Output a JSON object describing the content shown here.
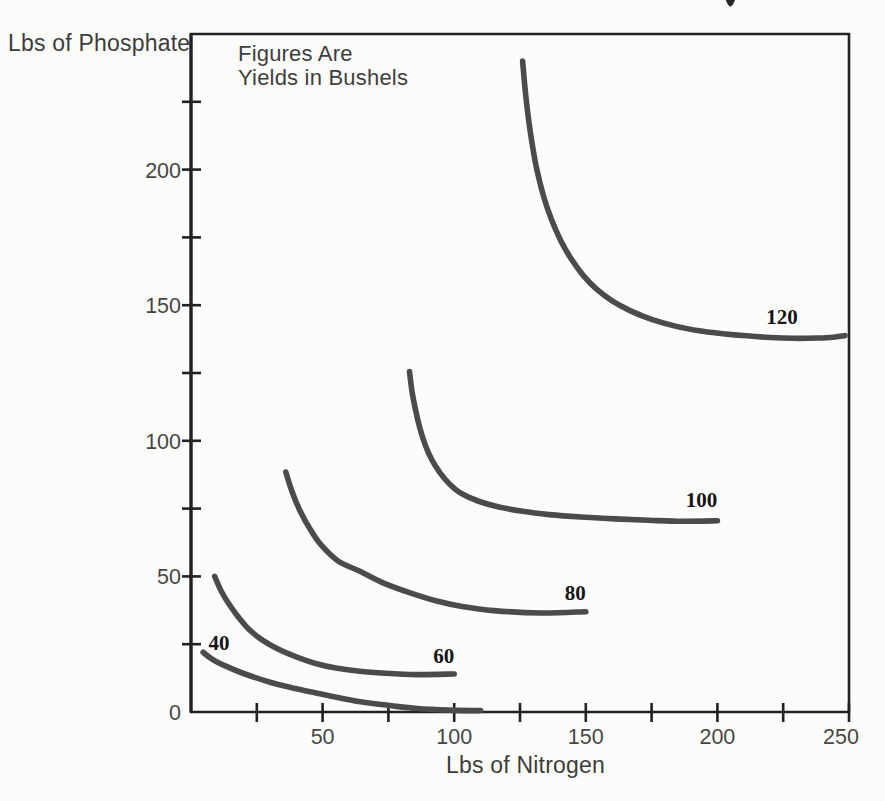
{
  "figure": {
    "y_axis_title": "Lbs of Phosphate",
    "x_axis_title": "Lbs of Nitrogen",
    "note_line1": "Figures Are",
    "note_line2": "Yields in Bushels"
  },
  "colors": {
    "background": "#fcfcfb",
    "axis": "#222222",
    "tick_label": "#464646",
    "title_text": "#3c3c3c",
    "curve": "#4b4b4b",
    "curve_label": "#151515"
  },
  "chart_data": {
    "type": "line",
    "subtype": "isoquant-map",
    "title": "",
    "annotation": "Figures Are Yields in Bushels",
    "xlabel": "Lbs of Nitrogen",
    "ylabel": "Lbs of Phosphate",
    "xlim": [
      0,
      250
    ],
    "ylim": [
      0,
      250
    ],
    "grid": false,
    "legend": "inline-curve-labels",
    "x_major_ticks": [
      50,
      100,
      150,
      200,
      250
    ],
    "x_minor_ticks": [
      25,
      75,
      125,
      175,
      225
    ],
    "y_major_ticks": [
      0,
      50,
      100,
      150,
      200
    ],
    "y_minor_ticks": [
      25,
      75,
      125,
      175,
      225
    ],
    "series": [
      {
        "name": "40",
        "yield_bushels": 40,
        "label_xy": [
          10.6,
          25.6
        ],
        "points": [
          [
            4.6,
            22
          ],
          [
            8,
            19.5
          ],
          [
            13,
            17
          ],
          [
            20,
            14.2
          ],
          [
            30,
            11
          ],
          [
            40,
            8.6
          ],
          [
            48,
            6.9
          ],
          [
            58,
            4.9
          ],
          [
            67,
            3.4
          ],
          [
            77,
            2.2
          ],
          [
            86,
            1.3
          ],
          [
            98,
            0.7
          ],
          [
            110,
            0.5
          ]
        ]
      },
      {
        "name": "60",
        "yield_bushels": 60,
        "label_xy": [
          96,
          20.8
        ],
        "points": [
          [
            9,
            50
          ],
          [
            11,
            45.5
          ],
          [
            13,
            42
          ],
          [
            15.5,
            38.3
          ],
          [
            18,
            35
          ],
          [
            22,
            30.5
          ],
          [
            27,
            26.6
          ],
          [
            33,
            23.2
          ],
          [
            40,
            20.3
          ],
          [
            47,
            18
          ],
          [
            55,
            16.2
          ],
          [
            64,
            15
          ],
          [
            74,
            14.3
          ],
          [
            86,
            13.8
          ],
          [
            100,
            14
          ]
        ]
      },
      {
        "name": "80",
        "yield_bushels": 80,
        "label_xy": [
          146,
          44
        ],
        "points": [
          [
            36,
            88.5
          ],
          [
            38.5,
            81
          ],
          [
            41.5,
            74
          ],
          [
            45.5,
            67
          ],
          [
            49.5,
            61.5
          ],
          [
            56,
            55.6
          ],
          [
            64,
            52
          ],
          [
            73,
            47.6
          ],
          [
            83,
            44
          ],
          [
            93,
            41
          ],
          [
            103,
            38.9
          ],
          [
            115,
            37.4
          ],
          [
            133,
            36.5
          ],
          [
            150,
            37
          ]
        ]
      },
      {
        "name": "100",
        "yield_bushels": 100,
        "label_xy": [
          194,
          78.2
        ],
        "points": [
          [
            83,
            125.5
          ],
          [
            84,
            118
          ],
          [
            85.3,
            111.5
          ],
          [
            87,
            104.5
          ],
          [
            89,
            98.5
          ],
          [
            91.5,
            93
          ],
          [
            94.5,
            88.4
          ],
          [
            98,
            84.3
          ],
          [
            102,
            81
          ],
          [
            109,
            77.8
          ],
          [
            117,
            75.6
          ],
          [
            126,
            74
          ],
          [
            136,
            72.8
          ],
          [
            148,
            71.9
          ],
          [
            161,
            71.2
          ],
          [
            174,
            70.7
          ],
          [
            187,
            70.3
          ],
          [
            200,
            70.5
          ]
        ]
      },
      {
        "name": "120",
        "yield_bushels": 120,
        "label_xy": [
          224.5,
          145.5
        ],
        "points": [
          [
            126,
            240
          ],
          [
            127,
            229
          ],
          [
            128.2,
            219
          ],
          [
            129.7,
            209
          ],
          [
            131.5,
            199.6
          ],
          [
            134,
            190
          ],
          [
            137,
            181.5
          ],
          [
            140.5,
            173.8
          ],
          [
            144.5,
            167
          ],
          [
            149,
            161
          ],
          [
            154,
            156
          ],
          [
            160,
            151.6
          ],
          [
            167,
            147.9
          ],
          [
            175,
            144.8
          ],
          [
            184,
            142.3
          ],
          [
            193,
            140.6
          ],
          [
            202,
            139.5
          ],
          [
            211,
            138.7
          ],
          [
            220,
            138.1
          ],
          [
            229,
            137.8
          ],
          [
            238,
            137.9
          ],
          [
            244,
            138.2
          ],
          [
            248.5,
            138.8
          ]
        ]
      }
    ]
  }
}
